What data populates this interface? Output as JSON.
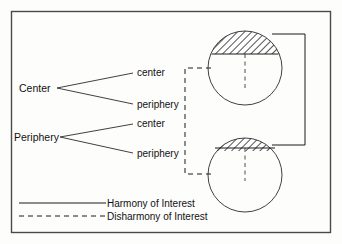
{
  "figure": {
    "frame_color": "#4a4a4a",
    "line_color": "#1a1a1a",
    "background": "#fdfdfc"
  },
  "actors": [
    {
      "id": "center",
      "label": "Center",
      "parts": [
        {
          "id": "center-center",
          "label": "center"
        },
        {
          "id": "center-periphery",
          "label": "periphery"
        }
      ]
    },
    {
      "id": "periphery",
      "label": "Periphery",
      "parts": [
        {
          "id": "periphery-center",
          "label": "center"
        },
        {
          "id": "periphery-periphery",
          "label": "periphery"
        }
      ]
    }
  ],
  "nations": [
    {
      "id": "center-nation",
      "cx": 245,
      "cy": 68,
      "r": 37,
      "cap_label": "elite-segment",
      "cap_offset": 14
    },
    {
      "id": "periphery-nation",
      "cx": 245,
      "cy": 175,
      "r": 37,
      "cap_label": "elite-segment",
      "cap_offset": 28
    }
  ],
  "relations": [
    {
      "id": "harmony-link",
      "style": "solid",
      "meaning": "Harmony of Interest",
      "connects": [
        "center-nation-cap",
        "periphery-nation-cap"
      ]
    },
    {
      "id": "disharmony-link",
      "style": "dashed",
      "meaning": "Disharmony of Interest",
      "connects": [
        "center-nation-body",
        "periphery-nation-body"
      ]
    }
  ],
  "legend": {
    "items": [
      {
        "id": "legend-harmony",
        "style": "solid",
        "label": "Harmony of Interest"
      },
      {
        "id": "legend-disharmony",
        "style": "dashed",
        "label": "Disharmony of Interest"
      }
    ]
  }
}
